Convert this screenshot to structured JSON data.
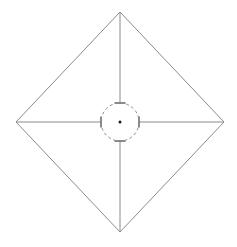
{
  "canvas": {
    "width": 237,
    "height": 247,
    "background_color": "#ffffff",
    "title": "Technical Line Drawing"
  },
  "style": {
    "outline_color": "#8a8a8a",
    "outline_width": 1,
    "radial_line_color": "#8a8a8a",
    "radial_line_width": 1,
    "tick_color": "#6e6e6e",
    "tick_width": 1.6,
    "circle_color": "#8a8a8a",
    "circle_width": 1,
    "circle_dash_pattern": "3 2.6",
    "center_dot_color": "#1a1a1a"
  },
  "chart_data": {
    "type": "diagram",
    "title": "",
    "xlabel": "",
    "ylabel": "",
    "center": {
      "x": 120,
      "y": 122
    },
    "diamond": {
      "name": "diamond-outline",
      "points": "120,12 224,122 120,232 16,122",
      "vertices": [
        {
          "label": "top",
          "x": 120,
          "y": 12
        },
        {
          "label": "right",
          "x": 224,
          "y": 122
        },
        {
          "label": "bottom",
          "x": 120,
          "y": 232
        },
        {
          "label": "left",
          "x": 16,
          "y": 122
        }
      ]
    },
    "center_circle": {
      "cx": 120,
      "cy": 122,
      "r": 19,
      "dashed": true
    },
    "center_dot": {
      "cx": 120,
      "cy": 122,
      "r": 1.5
    },
    "radial_lines": [
      {
        "label": "north",
        "x1": 120,
        "y1": 12,
        "x2": 120,
        "y2": 103,
        "tick": {
          "x1": 114.5,
          "y1": 103,
          "x2": 125.5,
          "y2": 103
        }
      },
      {
        "label": "east",
        "x1": 224,
        "y1": 122,
        "x2": 139,
        "y2": 122,
        "tick": {
          "x1": 139,
          "y1": 116.5,
          "x2": 139,
          "y2": 127.5
        }
      },
      {
        "label": "south",
        "x1": 120,
        "y1": 232,
        "x2": 120,
        "y2": 141,
        "tick": {
          "x1": 114.5,
          "y1": 141,
          "x2": 125.5,
          "y2": 141
        }
      },
      {
        "label": "west",
        "x1": 16,
        "y1": 122,
        "x2": 101,
        "y2": 122,
        "tick": {
          "x1": 101,
          "y1": 116.5,
          "x2": 101,
          "y2": 127.5
        }
      }
    ]
  }
}
